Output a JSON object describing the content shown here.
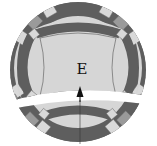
{
  "diagram": {
    "type": "quilt-block",
    "center_label": "E",
    "arrow_direction": "up",
    "colors": {
      "background": "#ffffff",
      "center_fill": "#d6d6d6",
      "arc_dark": "#5e5e5e",
      "arc_light": "#d9d9d9",
      "corner_medium": "#9a9a9a",
      "outline": "#444444",
      "gap": "#ffffff",
      "arrow": "#111111"
    }
  }
}
